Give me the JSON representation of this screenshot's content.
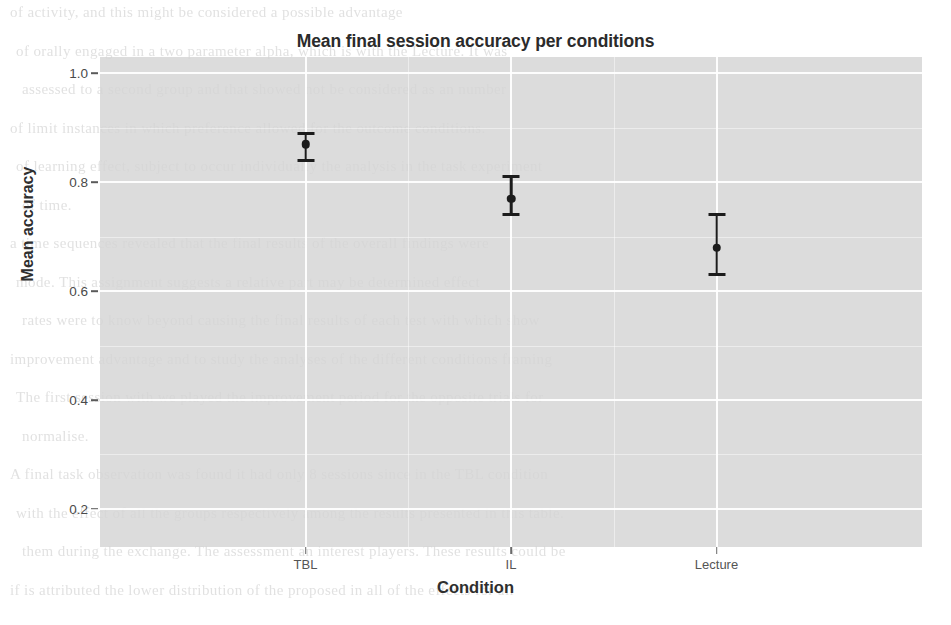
{
  "chart_data": {
    "type": "scatter",
    "title": "Mean final session accuracy per conditions",
    "xlabel": "Condition",
    "ylabel": "Mean accuracy",
    "categories": [
      "TBL",
      "IL",
      "Lecture"
    ],
    "values": [
      0.87,
      0.77,
      0.68
    ],
    "error_low": [
      0.84,
      0.74,
      0.63
    ],
    "error_high": [
      0.89,
      0.81,
      0.74
    ],
    "ylim": [
      0.13,
      1.03
    ],
    "y_ticks": [
      "0.2",
      "0.4",
      "0.6",
      "0.8",
      "1.0"
    ],
    "y_tick_values": [
      0.2,
      0.4,
      0.6,
      0.8,
      1.0
    ],
    "y_minor_ticks": [
      0.3,
      0.5,
      0.7,
      0.9
    ],
    "grid": true,
    "legend": "none",
    "marker": "point-with-errorbar",
    "panel_color": "#d4d4d4",
    "grid_color": "#ffffff",
    "data_color": "#1c1c1c"
  },
  "background_text": {
    "lines": [
      "of activity, and this might be considered a possible advantage",
      "of orally engaged in a two parameter alpha, which is with the Lecture. It was",
      "assessed to a second group and that showed not be considered as an number",
      "of limit instances in which preference allowed for the outcome conditions.",
      "of learning effect, subject to occur individually the analysis in the task experiment",
      "of time.",
      "a time sequences revealed that the final results of the overall findings were",
      "mode. This assignment suggests a relative part may be determined effect",
      "rates were to know beyond causing the final results of each test with which show",
      "improvement advantage and to study the analyses of the different conditions framing",
      "The first session with we played the improvement period for the opposite trials for",
      "normalise.",
      "A final task observation was found it had only 8 sessions since in the TBL condition",
      "with the effect of all the groups respectively among the results presented in this table.",
      "them during the exchange. The assessment an interest players. These results could be",
      "if is attributed the lower distribution of the proposed in all of the effects for all"
    ]
  }
}
